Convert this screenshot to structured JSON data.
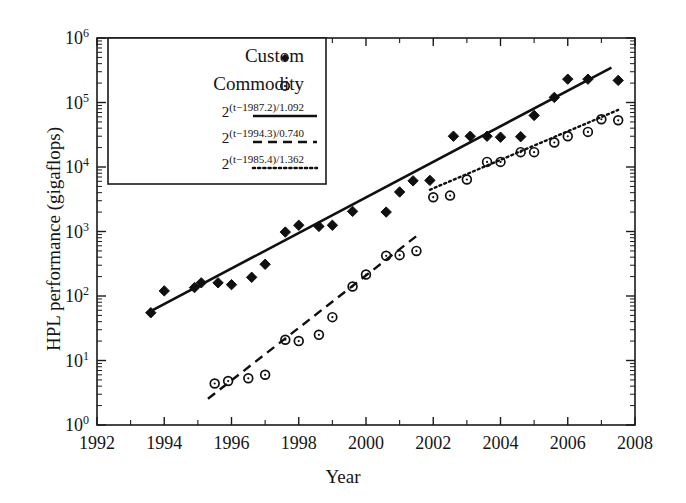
{
  "chart_data": {
    "type": "scatter",
    "title": "",
    "xlabel": "Year",
    "ylabel": "HPL performance (gigaflops)",
    "xlim": [
      1992,
      2008
    ],
    "ylim": [
      1,
      1000000
    ],
    "yscale": "log",
    "xticks": [
      1992,
      1994,
      1996,
      1998,
      2000,
      2002,
      2004,
      2006,
      2008
    ],
    "xtick_labels": [
      "1992",
      "1994",
      "1996",
      "1998",
      "2000",
      "2002",
      "2004",
      "2006",
      "2008"
    ],
    "yticks": [
      1,
      10,
      100,
      1000,
      10000,
      100000,
      1000000
    ],
    "ytick_labels": [
      "10",
      "10",
      "10",
      "10",
      "10",
      "10",
      "10"
    ],
    "ytick_exponents": [
      "0",
      "1",
      "2",
      "3",
      "4",
      "5",
      "6"
    ],
    "grid": false,
    "legend_position": "upper-left",
    "series": [
      {
        "name": "Custom",
        "marker": "filled-diamond",
        "color": "#101010",
        "points": [
          [
            1993.6,
            55
          ],
          [
            1994.0,
            120
          ],
          [
            1994.9,
            135
          ],
          [
            1995.1,
            160
          ],
          [
            1995.6,
            160
          ],
          [
            1996.0,
            150
          ],
          [
            1996.6,
            195
          ],
          [
            1997.0,
            310
          ],
          [
            1997.6,
            980
          ],
          [
            1998.0,
            1250
          ],
          [
            1998.6,
            1200
          ],
          [
            1999.0,
            1250
          ],
          [
            1999.6,
            2050
          ],
          [
            2000.6,
            2000
          ],
          [
            2001.0,
            4100
          ],
          [
            2001.4,
            6100
          ],
          [
            2001.9,
            6200
          ],
          [
            2002.6,
            30000
          ],
          [
            2003.1,
            30000
          ],
          [
            2003.6,
            30000
          ],
          [
            2004.0,
            29000
          ],
          [
            2004.6,
            29500
          ],
          [
            2005.0,
            63000
          ],
          [
            2005.6,
            120000
          ],
          [
            2006.0,
            230000
          ],
          [
            2006.6,
            230000
          ],
          [
            2007.5,
            220000
          ]
        ]
      },
      {
        "name": "Commodity",
        "marker": "open-circle",
        "color": "#101010",
        "points": [
          [
            1995.5,
            4.4
          ],
          [
            1995.9,
            4.8
          ],
          [
            1996.5,
            5.3
          ],
          [
            1997.0,
            6.0
          ],
          [
            1997.6,
            21
          ],
          [
            1998.0,
            20
          ],
          [
            1998.6,
            25
          ],
          [
            1999.0,
            47
          ],
          [
            1999.6,
            140
          ],
          [
            2000.0,
            215
          ],
          [
            2000.6,
            420
          ],
          [
            2001.0,
            430
          ],
          [
            2001.5,
            500
          ],
          [
            2002.0,
            3400
          ],
          [
            2002.5,
            3600
          ],
          [
            2003.0,
            6400
          ],
          [
            2003.6,
            12000
          ],
          [
            2004.0,
            12000
          ],
          [
            2004.6,
            17000
          ],
          [
            2005.0,
            17000
          ],
          [
            2005.6,
            24000
          ],
          [
            2006.0,
            30000
          ],
          [
            2006.6,
            35000
          ],
          [
            2007.0,
            55000
          ],
          [
            2007.5,
            53000
          ]
        ]
      }
    ],
    "fit_lines": [
      {
        "label": "2",
        "exponent": "(t−1987.2)/1.092",
        "style": "solid",
        "color": "#101010",
        "t0": 1987.2,
        "doubling_years": 1.092,
        "x_range": [
          1993.6,
          2007.3
        ]
      },
      {
        "label": "2",
        "exponent": "(t−1994.3)/0.740",
        "style": "dashed",
        "color": "#101010",
        "t0": 1994.3,
        "doubling_years": 0.74,
        "x_range": [
          1995.3,
          2001.6
        ]
      },
      {
        "label": "2",
        "exponent": "(t−1985.4)/1.362",
        "style": "dotted",
        "color": "#101010",
        "t0": 1985.4,
        "doubling_years": 1.362,
        "x_range": [
          2001.9,
          2007.5
        ]
      }
    ],
    "legend_entries": [
      {
        "label": "Custom",
        "kind": "marker",
        "marker": "filled-diamond"
      },
      {
        "label": "Commodity",
        "kind": "marker",
        "marker": "open-circle"
      },
      {
        "label": "2",
        "sup": "(t−1987.2)/1.092",
        "kind": "line",
        "style": "solid"
      },
      {
        "label": "2",
        "sup": "(t−1994.3)/0.740",
        "kind": "line",
        "style": "dashed"
      },
      {
        "label": "2",
        "sup": "(t−1985.4)/1.362",
        "kind": "line",
        "style": "dotted"
      }
    ]
  }
}
